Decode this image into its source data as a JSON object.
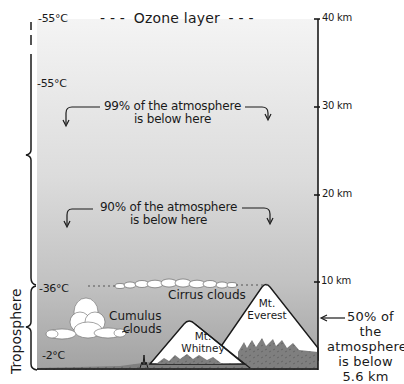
{
  "diagram": {
    "title": "Ozone layer",
    "title_dashes_left": "- - -",
    "title_dashes_right": "- - -",
    "colors": {
      "sky_top": "#f2f2f2",
      "sky_bottom": "#a4a4a4",
      "ground": "#7d7d7d",
      "snow": "#ffffff",
      "ink": "#1a1a1a"
    },
    "altitude_axis": {
      "ticks": [
        {
          "label": "40 km",
          "value": 40
        },
        {
          "label": "30 km",
          "value": 30
        },
        {
          "label": "20 km",
          "value": 20
        },
        {
          "label": "10 km",
          "value": 10
        }
      ]
    },
    "temperatures": [
      {
        "label": "-55°C",
        "altitude_km": 40
      },
      {
        "label": "-55°C",
        "altitude_km": 32.5
      },
      {
        "label": "-36°C",
        "altitude_km": 9.3
      },
      {
        "label": "-2°C",
        "altitude_km": 1.8
      }
    ],
    "annotations": {
      "ninety_nine": {
        "line1": "99% of the atmosphere",
        "line2": "is below here"
      },
      "ninety": {
        "line1": "90% of the atmosphere",
        "line2": "is below here"
      },
      "fifty": {
        "line1": "50% of the",
        "line2": "atmosphere",
        "line3": "is below",
        "line4": "5.6 km"
      }
    },
    "clouds": {
      "cirrus": "Cirrus clouds",
      "cumulus_line1": "Cumulus",
      "cumulus_line2": "clouds"
    },
    "mountains": {
      "everest": {
        "line1": "Mt.",
        "line2": "Everest"
      },
      "whitney": {
        "line1": "Mt.",
        "line2": "Whitney"
      }
    },
    "layers": {
      "troposphere": "Troposphere"
    }
  }
}
